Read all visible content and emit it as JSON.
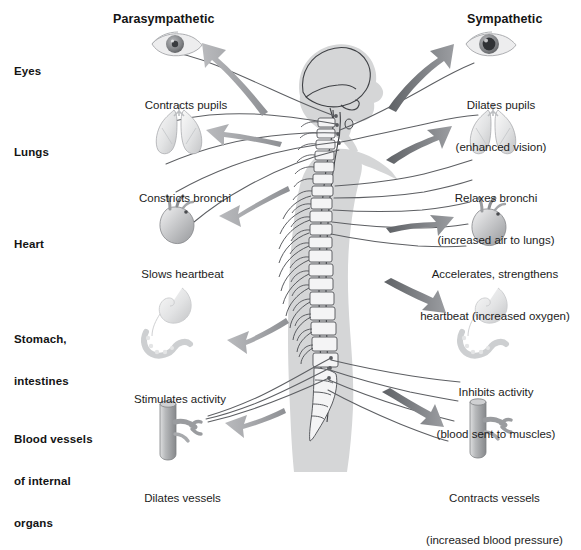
{
  "figure": {
    "background_color": "#ffffff",
    "body_silhouette_color": "#d5d6d7",
    "nerve_line_color": "#5d5f63",
    "arrow_color_left": "#9a9c9f",
    "arrow_color_right": "#6e7175"
  },
  "columns": {
    "left_heading": "Parasympathetic",
    "right_heading": "Sympathetic"
  },
  "rows": [
    {
      "label": "Eyes",
      "label_lines": [
        "Eyes"
      ],
      "left_icon": "eye-constricted-icon",
      "left_caption_lines": [
        "Contracts pupils"
      ],
      "right_icon": "eye-dilated-icon",
      "right_caption_lines": [
        "Dilates pupils",
        "(enhanced vision)"
      ]
    },
    {
      "label": "Lungs",
      "label_lines": [
        "Lungs"
      ],
      "left_icon": "lungs-icon",
      "left_caption_lines": [
        "Constricts bronchi"
      ],
      "right_icon": "lungs-icon",
      "right_caption_lines": [
        "Relaxes bronchi",
        "(increased air to lungs)"
      ]
    },
    {
      "label": "Heart",
      "label_lines": [
        "Heart"
      ],
      "left_icon": "heart-icon",
      "left_caption_lines": [
        "Slows heartbeat"
      ],
      "right_icon": "heart-icon",
      "right_caption_lines": [
        "Accelerates, strengthens",
        "heartbeat (increased oxygen)"
      ]
    },
    {
      "label": "Stomach, intestines",
      "label_lines": [
        "Stomach,",
        "intestines"
      ],
      "left_icon": "stomach-intestines-icon",
      "left_caption_lines": [
        "Stimulates activity"
      ],
      "right_icon": "stomach-intestines-icon",
      "right_caption_lines": [
        "Inhibits activity",
        "(blood sent to muscles)"
      ]
    },
    {
      "label": "Blood vessels of internal organs",
      "label_lines": [
        "Blood vessels",
        "of internal",
        "organs"
      ],
      "left_icon": "blood-vessel-icon",
      "left_caption_lines": [
        "Dilates vessels"
      ],
      "right_icon": "blood-vessel-icon",
      "right_caption_lines": [
        "Contracts vessels",
        "(increased blood pressure)"
      ]
    }
  ],
  "center_figure": {
    "name": "human-body-nervous-system",
    "parts": [
      "head-profile-silhouette",
      "brain-outline",
      "spinal-cord",
      "vertebral-column",
      "ribs",
      "sacrum",
      "nerve-fibers"
    ]
  }
}
